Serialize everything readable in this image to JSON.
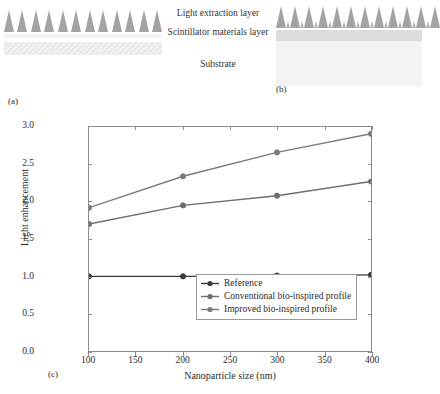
{
  "figure": {
    "panel_labels": {
      "a": "(a)",
      "b": "(b)",
      "c": "(c)"
    },
    "layer_labels": {
      "extraction": "Light extraction layer",
      "scintillator": "Scintillator materials layer",
      "substrate": "Substrate"
    },
    "colors": {
      "spike_large": "#a3a3a3",
      "spike_small": "#b9b9b9",
      "scintillator_band": "#dcdcdc",
      "substrate_band": "#f3f3f3",
      "axis": "#8c8c8c",
      "reference_series": "#3a3a3a",
      "conventional_series": "#6e6e6e",
      "improved_series": "#7a7a7a"
    },
    "panel_a": {
      "large_spike_count": 12,
      "small_spike_count": 0
    },
    "panel_b": {
      "large_spike_count": 12,
      "small_spike_count": 12
    }
  },
  "chart_data": {
    "type": "line",
    "title": "",
    "xlabel": "Nanoparticle size (nm)",
    "ylabel": "Light enhancement",
    "x": [
      100,
      200,
      300,
      400
    ],
    "xlim": [
      100,
      400
    ],
    "ylim": [
      0.0,
      3.0
    ],
    "xticks": [
      100,
      150,
      200,
      250,
      300,
      350,
      400
    ],
    "xticklabels": [
      "100",
      "150",
      "200",
      "250",
      "300",
      "350",
      "400"
    ],
    "yticks": [
      0.0,
      0.5,
      1.0,
      1.5,
      2.0,
      2.5,
      3.0
    ],
    "yticklabels": [
      "0.0",
      "0.5",
      "1.0",
      "1.5",
      "2.0",
      "2.5",
      "3.0"
    ],
    "grid": false,
    "legend_position": "lower right",
    "series": [
      {
        "name": "Reference",
        "values": [
          1.0,
          1.0,
          1.01,
          1.02
        ],
        "color": "#3a3a3a",
        "marker": "circle"
      },
      {
        "name": "Conventional bio-inspired profile",
        "values": [
          1.7,
          1.95,
          2.08,
          2.27
        ],
        "color": "#6e6e6e",
        "marker": "circle"
      },
      {
        "name": "Improved bio-inspired profile",
        "values": [
          1.92,
          2.34,
          2.66,
          2.91
        ],
        "color": "#7a7a7a",
        "marker": "circle"
      }
    ]
  }
}
